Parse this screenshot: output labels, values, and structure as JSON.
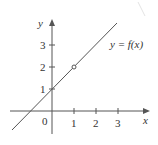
{
  "diagram": {
    "type": "function-graph",
    "function_label": "y = f(x)",
    "axes": {
      "x_label": "x",
      "y_label": "y",
      "origin_label": "0",
      "x_ticks": [
        "1",
        "2",
        "3"
      ],
      "y_ticks": [
        "1",
        "2",
        "3"
      ]
    },
    "line": {
      "equation": "y = x + 1",
      "hole_at": {
        "x": 1,
        "y": 2
      }
    },
    "colors": {
      "axis": "#555555",
      "line": "#555555",
      "text": "#333333"
    }
  }
}
